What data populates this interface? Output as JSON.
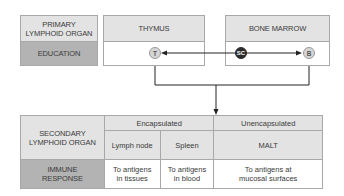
{
  "primary": {
    "row_header": "PRIMARY LYMPHOID ORGAN",
    "education_label": "EDUCATION",
    "organs": [
      {
        "name": "THYMUS",
        "cell": "T"
      },
      {
        "name": "BONE MARROW",
        "cells": [
          "SC",
          "B"
        ]
      }
    ]
  },
  "secondary": {
    "row_header": "SECONDARY LYMPHOID ORGAN",
    "response_label": "IMMUNE RESPONSE",
    "groups": [
      {
        "label": "Encapsulated",
        "organs": [
          "Lymph node",
          "Spleen"
        ]
      },
      {
        "label": "Unencapsulated",
        "organs": [
          "MALT"
        ]
      }
    ],
    "responses": [
      "To antigens in tissues",
      "To antigens in blood",
      "To antigens at mucosal surfaces"
    ]
  },
  "colors": {
    "header_fill": "#e3e3e3",
    "label_fill": "#b3b3b3",
    "stem_cell": "#2a2a2a",
    "lymphocyte": "#d6d6d6",
    "line": "#222222"
  }
}
